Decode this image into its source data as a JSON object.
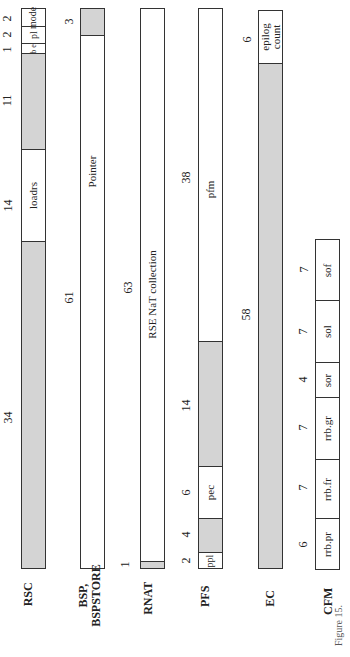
{
  "registers": {
    "rsc": {
      "label": "RSC",
      "fields": [
        {
          "name": "mode",
          "bits": "2"
        },
        {
          "name": "pl",
          "bits": "2"
        },
        {
          "name": "be",
          "bits": "1"
        },
        {
          "name": "",
          "bits": "11",
          "reserved": true
        },
        {
          "name": "loadrs",
          "bits": "14"
        },
        {
          "name": "",
          "bits": "34",
          "reserved": true
        }
      ]
    },
    "bsp": {
      "label_line1": "BSP,",
      "label_line2": "BSPSTORE",
      "fields": [
        {
          "name": "",
          "bits": "3",
          "reserved": true
        },
        {
          "name": "Pointer",
          "bits": "61"
        }
      ]
    },
    "rnat": {
      "label": "RNAT",
      "fields": [
        {
          "name": "RSE NaT collection",
          "bits": "63"
        },
        {
          "name": "",
          "bits": "1",
          "reserved": true
        }
      ]
    },
    "pfs": {
      "label": "PFS",
      "fields": [
        {
          "name": "pfm",
          "bits": "38"
        },
        {
          "name": "",
          "bits": "14",
          "reserved": true
        },
        {
          "name": "pec",
          "bits": "6"
        },
        {
          "name": "",
          "bits": "4",
          "reserved": true
        },
        {
          "name": "ppl",
          "bits": "2"
        }
      ]
    },
    "ec": {
      "label": "EC",
      "fields": [
        {
          "name_line1": "epilog",
          "name_line2": "count",
          "bits": "6"
        },
        {
          "name": "",
          "bits": "58",
          "reserved": true
        }
      ]
    },
    "cfm": {
      "label": "CFM",
      "fields": [
        {
          "name": "sof",
          "bits": "7"
        },
        {
          "name": "sol",
          "bits": "7"
        },
        {
          "name": "sor",
          "bits": "4"
        },
        {
          "name": "rrb.gr",
          "bits": "7"
        },
        {
          "name": "rrb.fr",
          "bits": "7"
        },
        {
          "name": "rrb.pr",
          "bits": "6"
        }
      ]
    }
  },
  "caption": "Figure 15.",
  "colors": {
    "reserved_fill": "#d4d4d4",
    "border": "#333333"
  }
}
